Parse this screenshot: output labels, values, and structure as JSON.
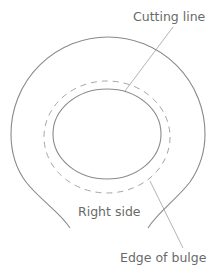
{
  "diagram": {
    "labels": {
      "cutting_line": "Cutting line",
      "right_side": "Right side",
      "edge_of_bulge": "Edge of bulge"
    },
    "colors": {
      "stroke": "#8a8a8a",
      "dashed": "#a5a5a5",
      "text": "#6a6a6a",
      "background": "#ffffff"
    }
  }
}
